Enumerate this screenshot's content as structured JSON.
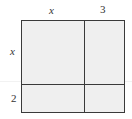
{
  "diagram": {
    "type": "area-model",
    "top_labels": [
      "x",
      "3"
    ],
    "side_labels": [
      "x",
      "2"
    ],
    "regions": [
      {
        "row": "x",
        "col": "x"
      },
      {
        "row": "x",
        "col": "3"
      },
      {
        "row": "2",
        "col": "x"
      },
      {
        "row": "2",
        "col": "3"
      }
    ],
    "colors": {
      "fill": "#efefef",
      "stroke": "#3a3a3a"
    }
  }
}
